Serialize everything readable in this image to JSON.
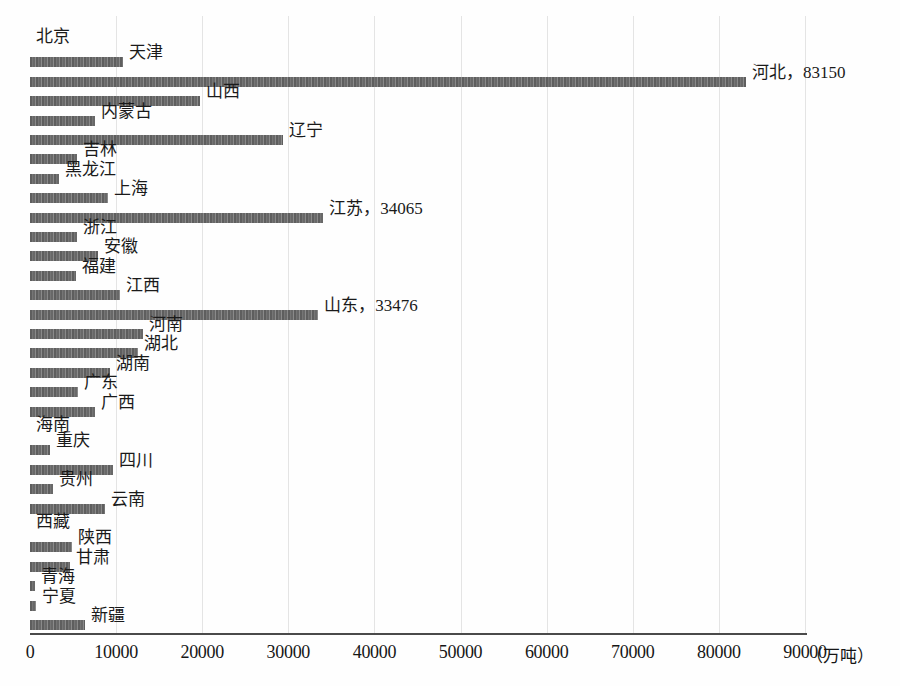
{
  "chart_data": {
    "type": "bar",
    "orientation": "horizontal",
    "title": "",
    "xlabel": "（万吨）",
    "ylabel": "",
    "xlim": [
      0,
      90000
    ],
    "grid": true,
    "legend": false,
    "unit": "（万吨）",
    "xticks": [
      "0",
      "10000",
      "20000",
      "30000",
      "40000",
      "50000",
      "60000",
      "70000",
      "80000",
      "90000"
    ],
    "xtick_values": [
      0,
      10000,
      20000,
      30000,
      40000,
      50000,
      60000,
      70000,
      80000,
      90000
    ],
    "categories": [
      "北京",
      "天津",
      "河北",
      "山西",
      "内蒙古",
      "辽宁",
      "吉林",
      "黑龙江",
      "上海",
      "江苏",
      "浙江",
      "安徽",
      "福建",
      "江西",
      "山东",
      "河南",
      "湖北",
      "湖南",
      "广东",
      "广西",
      "海南",
      "重庆",
      "四川",
      "贵州",
      "云南",
      "西藏",
      "陕西",
      "甘肃",
      "青海",
      "宁夏",
      "新疆"
    ],
    "values": [
      0,
      10800,
      83150,
      19740,
      7550,
      29380,
      5450,
      3370,
      9050,
      34065,
      5450,
      7900,
      5340,
      10450,
      33476,
      13120,
      12540,
      9290,
      5570,
      7550,
      0,
      2320,
      9640,
      2670,
      8710,
      0,
      4880,
      4650,
      580,
      700,
      6390
    ],
    "point_labels": [
      "北京",
      "天津",
      "河北，83150",
      "山西",
      "内蒙古",
      "辽宁",
      "吉林",
      "黑龙江",
      "上海",
      "江苏，34065",
      "浙江",
      "安徽",
      "福建",
      "江西",
      "山东，33476",
      "河南",
      "湖北",
      "湖南",
      "广东",
      "广西",
      "海南",
      "重庆",
      "四川",
      "贵州",
      "云南",
      "西藏",
      "陕西",
      "甘肃",
      "青海",
      "宁夏",
      "新疆"
    ],
    "annotated_points": [
      {
        "category": "河北",
        "value": 83150,
        "label": "河北，83150"
      },
      {
        "category": "江苏",
        "value": 34065,
        "label": "江苏，34065"
      },
      {
        "category": "山东",
        "value": 33476,
        "label": "山东，33476"
      }
    ],
    "colors": {
      "bar": "#6a6a6a",
      "grid": "#e4e4e4",
      "axis": "#4a4a4a",
      "text": "#161616",
      "background": "#ffffff"
    }
  }
}
